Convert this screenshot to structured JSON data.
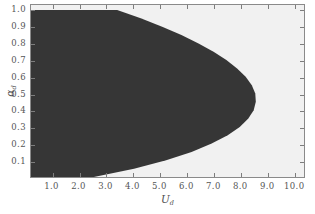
{
  "figure": {
    "width": 315,
    "height": 214,
    "background": "#ffffff"
  },
  "axes": {
    "frame_color": "#8a8a8a",
    "tick_color": "#7d7d7d",
    "label_color": "#555555"
  },
  "xlabel_main": "U",
  "xlabel_sub": "d",
  "ylabel_main": "α",
  "ylabel_sub": "d",
  "chart_data": {
    "type": "area",
    "title": "",
    "subtitle": "",
    "xlabel": "U_d",
    "ylabel": "alpha_d",
    "xlim": [
      0.2,
      10.4
    ],
    "ylim": [
      0.0,
      1.03
    ],
    "grid": false,
    "legend": null,
    "legend_position": "none",
    "xticks": [
      1.0,
      2.0,
      3.0,
      4.0,
      5.0,
      6.0,
      7.0,
      8.0,
      9.0,
      10.0
    ],
    "xticklabels": [
      "1.0",
      "2.0",
      "3.0",
      "4.0",
      "5.0",
      "6.0",
      "7.0",
      "8.0",
      "9.0",
      "10.0"
    ],
    "yticks": [
      0.1,
      0.2,
      0.3,
      0.4,
      0.5,
      0.6,
      0.7,
      0.8,
      0.9,
      1.0
    ],
    "yticklabels": [
      "0.1",
      "0.2",
      "0.3",
      "0.4",
      "0.5",
      "0.6",
      "0.7",
      "0.8",
      "0.9",
      "1.0"
    ],
    "regions": [
      {
        "name": "dark-region",
        "color": "#363636",
        "description": "filled stable region bounded on the right by a parabolic-like curve"
      },
      {
        "name": "light-region",
        "color": "#f1f1f1",
        "description": "background / outside region"
      }
    ],
    "boundary_curve": {
      "name": "region-boundary",
      "description": "right-hand boundary of the dark region: U_d as a function of alpha_d",
      "alpha_d": [
        0.0,
        0.05,
        0.1,
        0.15,
        0.2,
        0.25,
        0.3,
        0.35,
        0.4,
        0.45,
        0.5,
        0.55,
        0.6,
        0.65,
        0.7,
        0.75,
        0.8,
        0.85,
        0.9,
        0.95,
        1.0
      ],
      "U_d": [
        2.55,
        4.05,
        5.25,
        6.2,
        6.95,
        7.55,
        8.0,
        8.32,
        8.52,
        8.6,
        8.58,
        8.45,
        8.22,
        7.9,
        7.5,
        7.02,
        6.46,
        5.82,
        5.1,
        4.3,
        3.42
      ],
      "max_U_d": 8.6,
      "max_U_d_at_alpha": 0.45
    }
  }
}
